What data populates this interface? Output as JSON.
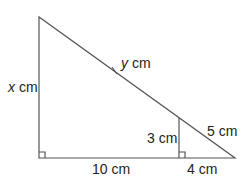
{
  "diagram": {
    "type": "similar right triangles",
    "labels": {
      "left_side_var": "x",
      "left_side_unit": " cm",
      "hyp_var": "y",
      "hyp_unit": " cm",
      "inner_height": "3 cm",
      "small_hyp": "5 cm",
      "base_left": "10 cm",
      "base_right": "4 cm"
    },
    "colors": {
      "line": "#555555",
      "text": "#231f20"
    }
  }
}
